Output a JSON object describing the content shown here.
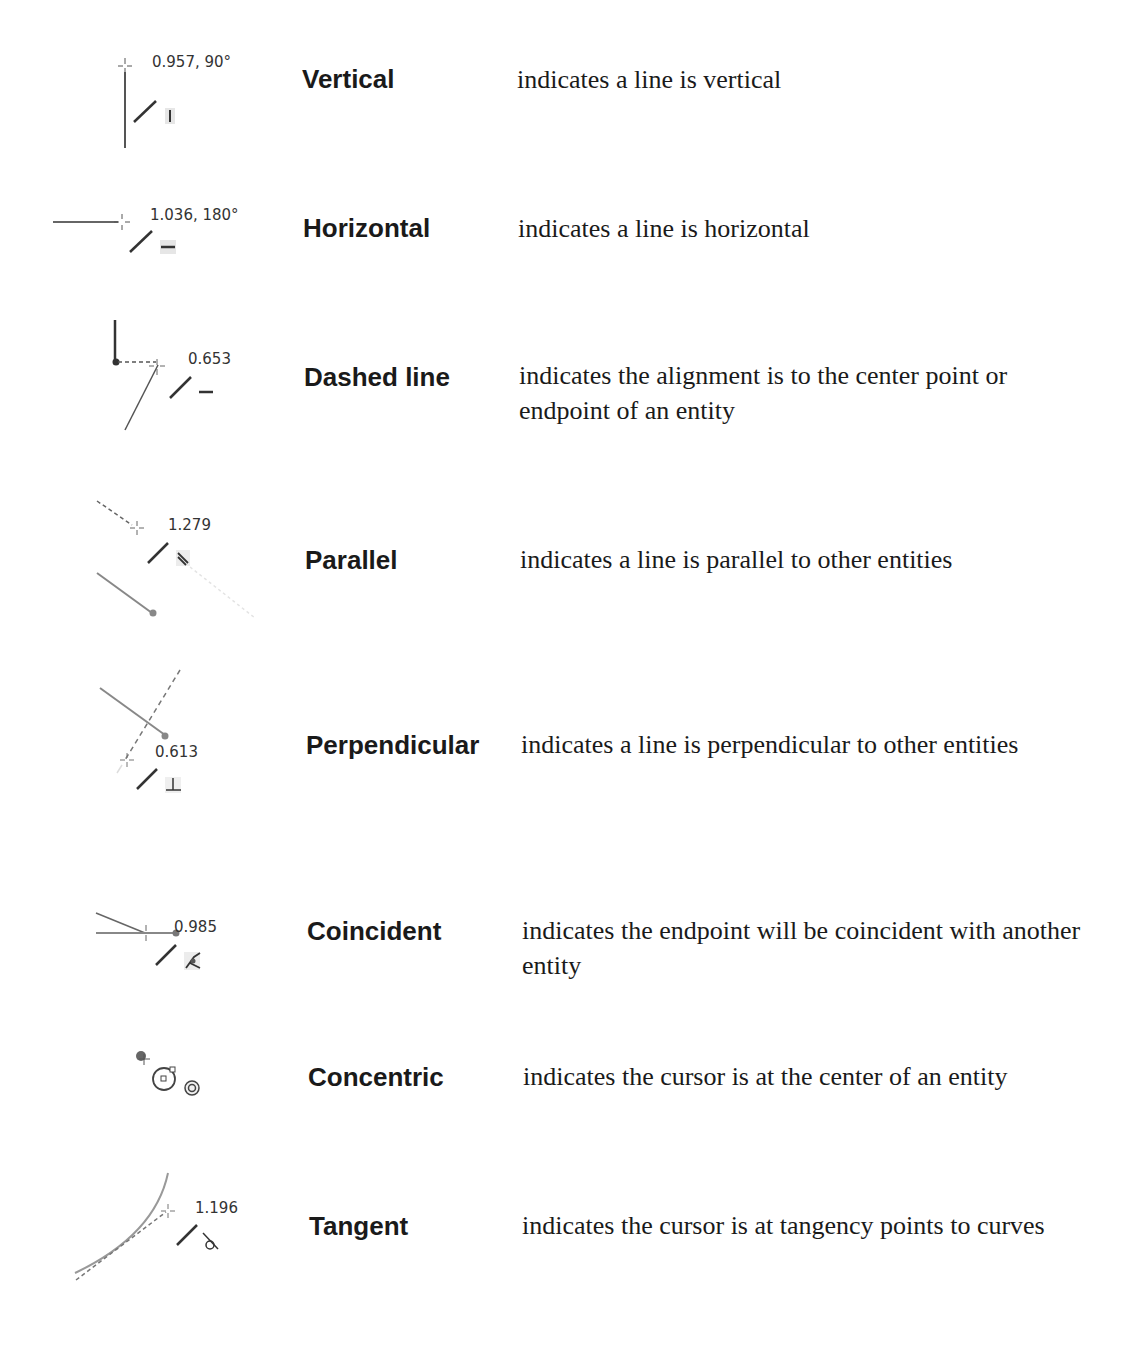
{
  "rows": [
    {
      "label": "Vertical",
      "description": "indicates a line is vertical",
      "icon_name": "vertical-relation-icon",
      "readout": "0.957, 90°",
      "glyph": "|"
    },
    {
      "label": "Horizontal",
      "description": "indicates a line is horizontal",
      "icon_name": "horizontal-relation-icon",
      "readout": "1.036, 180°",
      "glyph": "—"
    },
    {
      "label": "Dashed line",
      "description": "indicates the alignment is to the center point or endpoint of an entity",
      "icon_name": "dashed-line-inference-icon",
      "readout": "0.653",
      "glyph": "—"
    },
    {
      "label": "Parallel",
      "description": "indicates a line is parallel to other entities",
      "icon_name": "parallel-relation-icon",
      "readout": "1.279",
      "glyph": "∥"
    },
    {
      "label": "Perpendicular",
      "description": "indicates a line is perpendicular to other entities",
      "icon_name": "perpendicular-relation-icon",
      "readout": "0.613",
      "glyph": "⊥"
    },
    {
      "label": "Coincident",
      "description": "indicates the endpoint will be coincident with another entity",
      "icon_name": "coincident-relation-icon",
      "readout": "0.985",
      "glyph": "coincident"
    },
    {
      "label": "Concentric",
      "description": "indicates the cursor is at the center of an entity",
      "icon_name": "concentric-relation-icon",
      "readout": "",
      "glyph": "◎"
    },
    {
      "label": "Tangent",
      "description": "indicates the cursor is at tangency points to curves",
      "icon_name": "tangent-relation-icon",
      "readout": "1.196",
      "glyph": "tangent"
    }
  ]
}
